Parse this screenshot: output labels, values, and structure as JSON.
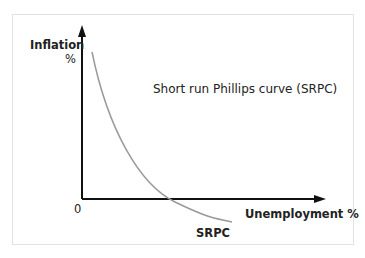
{
  "diagram": {
    "title": "Short run Phillips curve (SRPC)",
    "y_axis_label_line1": "Inflation",
    "y_axis_label_line2": "%",
    "x_axis_label": "Unemployment %",
    "origin_label": "0",
    "curve_label": "SRPC",
    "colors": {
      "axis": "#111111",
      "curve": "#9a9a9a",
      "border": "#e2e2e2"
    }
  }
}
